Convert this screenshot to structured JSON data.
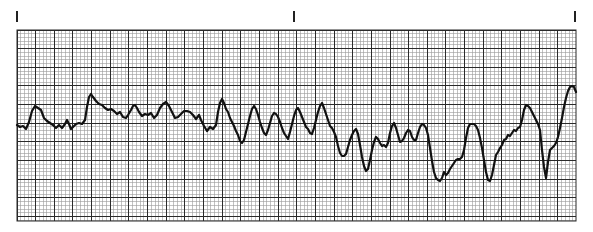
{
  "chart_data": {
    "type": "line",
    "title": "",
    "xlabel": "",
    "ylabel": "",
    "grid": true,
    "legend": null,
    "paper": {
      "left": 17,
      "top": 30,
      "right": 576,
      "bottom": 221,
      "minor_spacing": 3.73,
      "major_every": 5,
      "minor_color": "#9a9a9a",
      "major_color": "#2a2a2a",
      "background": "#ffffff"
    },
    "tick_marks_x": [
      17,
      294,
      575
    ],
    "trace_color": "#111111",
    "points": [
      [
        17,
        125
      ],
      [
        20,
        127
      ],
      [
        23,
        126
      ],
      [
        26,
        129
      ],
      [
        29,
        122
      ],
      [
        32,
        111
      ],
      [
        35,
        106
      ],
      [
        38,
        108
      ],
      [
        41,
        110
      ],
      [
        44,
        118
      ],
      [
        47,
        121
      ],
      [
        50,
        123
      ],
      [
        53,
        125
      ],
      [
        56,
        128
      ],
      [
        59,
        125
      ],
      [
        62,
        128
      ],
      [
        65,
        124
      ],
      [
        67,
        120
      ],
      [
        69,
        124
      ],
      [
        71,
        129
      ],
      [
        73,
        127
      ],
      [
        76,
        124
      ],
      [
        79,
        123
      ],
      [
        82,
        124
      ],
      [
        85,
        120
      ],
      [
        87,
        107
      ],
      [
        89,
        97
      ],
      [
        91,
        94
      ],
      [
        93,
        97
      ],
      [
        96,
        101
      ],
      [
        99,
        104
      ],
      [
        102,
        105
      ],
      [
        105,
        108
      ],
      [
        108,
        110
      ],
      [
        111,
        109
      ],
      [
        114,
        111
      ],
      [
        117,
        114
      ],
      [
        120,
        112
      ],
      [
        123,
        117
      ],
      [
        126,
        118
      ],
      [
        128,
        115
      ],
      [
        131,
        110
      ],
      [
        133,
        106
      ],
      [
        135,
        105
      ],
      [
        137,
        108
      ],
      [
        139,
        112
      ],
      [
        142,
        116
      ],
      [
        145,
        114
      ],
      [
        148,
        115
      ],
      [
        151,
        113
      ],
      [
        154,
        118
      ],
      [
        157,
        115
      ],
      [
        160,
        108
      ],
      [
        163,
        104
      ],
      [
        166,
        102
      ],
      [
        169,
        106
      ],
      [
        172,
        112
      ],
      [
        175,
        118
      ],
      [
        178,
        117
      ],
      [
        181,
        114
      ],
      [
        184,
        111
      ],
      [
        187,
        111
      ],
      [
        190,
        112
      ],
      [
        193,
        115
      ],
      [
        196,
        119
      ],
      [
        199,
        115
      ],
      [
        201,
        120
      ],
      [
        204,
        126
      ],
      [
        207,
        131
      ],
      [
        210,
        127
      ],
      [
        213,
        129
      ],
      [
        216,
        125
      ],
      [
        218,
        112
      ],
      [
        220,
        103
      ],
      [
        222,
        99
      ],
      [
        224,
        103
      ],
      [
        226,
        109
      ],
      [
        228,
        112
      ],
      [
        230,
        118
      ],
      [
        232,
        122
      ],
      [
        234,
        126
      ],
      [
        236,
        131
      ],
      [
        238,
        135
      ],
      [
        240,
        141
      ],
      [
        242,
        143
      ],
      [
        244,
        140
      ],
      [
        246,
        132
      ],
      [
        248,
        124
      ],
      [
        250,
        116
      ],
      [
        252,
        109
      ],
      [
        254,
        106
      ],
      [
        256,
        109
      ],
      [
        258,
        115
      ],
      [
        260,
        122
      ],
      [
        262,
        128
      ],
      [
        264,
        133
      ],
      [
        266,
        135
      ],
      [
        268,
        130
      ],
      [
        270,
        123
      ],
      [
        272,
        116
      ],
      [
        274,
        113
      ],
      [
        276,
        114
      ],
      [
        278,
        117
      ],
      [
        280,
        122
      ],
      [
        282,
        128
      ],
      [
        284,
        133
      ],
      [
        286,
        136
      ],
      [
        288,
        139
      ],
      [
        290,
        132
      ],
      [
        292,
        124
      ],
      [
        294,
        116
      ],
      [
        296,
        110
      ],
      [
        298,
        108
      ],
      [
        300,
        112
      ],
      [
        302,
        117
      ],
      [
        304,
        122
      ],
      [
        306,
        127
      ],
      [
        308,
        129
      ],
      [
        310,
        133
      ],
      [
        312,
        134
      ],
      [
        314,
        128
      ],
      [
        316,
        120
      ],
      [
        318,
        112
      ],
      [
        320,
        106
      ],
      [
        322,
        103
      ],
      [
        324,
        108
      ],
      [
        326,
        114
      ],
      [
        328,
        120
      ],
      [
        330,
        126
      ],
      [
        332,
        128
      ],
      [
        334,
        132
      ],
      [
        336,
        137
      ],
      [
        338,
        146
      ],
      [
        340,
        153
      ],
      [
        342,
        156
      ],
      [
        344,
        156
      ],
      [
        346,
        154
      ],
      [
        348,
        147
      ],
      [
        350,
        140
      ],
      [
        352,
        135
      ],
      [
        354,
        131
      ],
      [
        356,
        129
      ],
      [
        358,
        134
      ],
      [
        360,
        145
      ],
      [
        362,
        157
      ],
      [
        364,
        166
      ],
      [
        366,
        171
      ],
      [
        368,
        169
      ],
      [
        370,
        160
      ],
      [
        372,
        150
      ],
      [
        374,
        142
      ],
      [
        376,
        137
      ],
      [
        378,
        139
      ],
      [
        380,
        143
      ],
      [
        382,
        146
      ],
      [
        384,
        145
      ],
      [
        386,
        147
      ],
      [
        388,
        143
      ],
      [
        390,
        133
      ],
      [
        392,
        126
      ],
      [
        394,
        123
      ],
      [
        396,
        128
      ],
      [
        398,
        135
      ],
      [
        400,
        142
      ],
      [
        402,
        141
      ],
      [
        404,
        138
      ],
      [
        406,
        133
      ],
      [
        408,
        130
      ],
      [
        410,
        131
      ],
      [
        412,
        137
      ],
      [
        414,
        140
      ],
      [
        416,
        140
      ],
      [
        418,
        133
      ],
      [
        420,
        127
      ],
      [
        422,
        124
      ],
      [
        424,
        125
      ],
      [
        426,
        128
      ],
      [
        428,
        135
      ],
      [
        430,
        148
      ],
      [
        432,
        161
      ],
      [
        434,
        172
      ],
      [
        436,
        178
      ],
      [
        438,
        180
      ],
      [
        440,
        181
      ],
      [
        442,
        178
      ],
      [
        444,
        172
      ],
      [
        446,
        175
      ],
      [
        448,
        173
      ],
      [
        450,
        169
      ],
      [
        452,
        166
      ],
      [
        454,
        163
      ],
      [
        456,
        160
      ],
      [
        458,
        159
      ],
      [
        460,
        159
      ],
      [
        462,
        157
      ],
      [
        464,
        150
      ],
      [
        466,
        138
      ],
      [
        468,
        128
      ],
      [
        470,
        124
      ],
      [
        472,
        124
      ],
      [
        474,
        124
      ],
      [
        476,
        126
      ],
      [
        478,
        130
      ],
      [
        480,
        138
      ],
      [
        482,
        148
      ],
      [
        484,
        160
      ],
      [
        486,
        172
      ],
      [
        488,
        180
      ],
      [
        490,
        181
      ],
      [
        492,
        175
      ],
      [
        494,
        165
      ],
      [
        496,
        155
      ],
      [
        498,
        152
      ],
      [
        500,
        148
      ],
      [
        502,
        145
      ],
      [
        504,
        140
      ],
      [
        506,
        139
      ],
      [
        508,
        135
      ],
      [
        510,
        136
      ],
      [
        512,
        133
      ],
      [
        514,
        130
      ],
      [
        516,
        131
      ],
      [
        518,
        128
      ],
      [
        520,
        127
      ],
      [
        522,
        120
      ],
      [
        524,
        110
      ],
      [
        526,
        105
      ],
      [
        528,
        106
      ],
      [
        530,
        108
      ],
      [
        532,
        112
      ],
      [
        534,
        116
      ],
      [
        536,
        120
      ],
      [
        538,
        124
      ],
      [
        540,
        130
      ],
      [
        542,
        150
      ],
      [
        544,
        167
      ],
      [
        546,
        178
      ],
      [
        548,
        162
      ],
      [
        550,
        150
      ],
      [
        552,
        148
      ],
      [
        554,
        146
      ],
      [
        556,
        143
      ],
      [
        558,
        137
      ],
      [
        560,
        128
      ],
      [
        562,
        118
      ],
      [
        564,
        107
      ],
      [
        566,
        98
      ],
      [
        568,
        91
      ],
      [
        570,
        87
      ],
      [
        572,
        86
      ],
      [
        574,
        87
      ],
      [
        576,
        92
      ]
    ]
  }
}
